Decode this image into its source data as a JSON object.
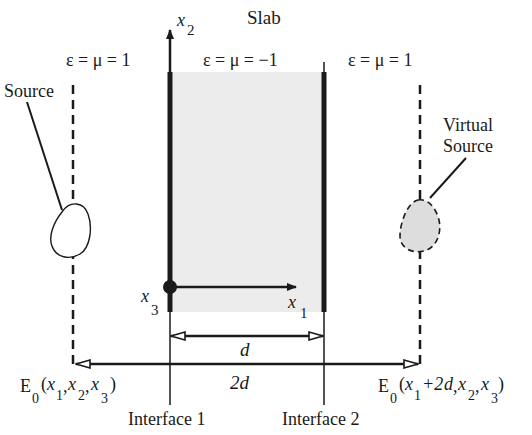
{
  "title": "Slab",
  "regions": {
    "left": {
      "label": "ε = μ = 1"
    },
    "slab": {
      "label": "ε = μ = −1",
      "fill": "#ececec"
    },
    "right": {
      "label": "ε = μ = 1"
    }
  },
  "axes": {
    "x1": {
      "base": "x",
      "sub": "1"
    },
    "x2": {
      "base": "x",
      "sub": "2"
    },
    "x3": {
      "base": "x",
      "sub": "3"
    }
  },
  "source": {
    "label": "Source"
  },
  "virtual_source": {
    "label_line1": "Virtual",
    "label_line2": "Source",
    "fill": "#dddddd"
  },
  "dimensions": {
    "d": "d",
    "two_d": "2d"
  },
  "fields": {
    "left": {
      "E": "E",
      "sub0": "0",
      "open": "(",
      "x": "x",
      "s1": "1",
      "comma1": ",",
      "s2": "2",
      "comma2": ",",
      "s3": "3",
      "close": ")"
    },
    "right": {
      "E": "E",
      "sub0": "0",
      "open": "(",
      "x": "x",
      "s1": "1",
      "plus": "+2",
      "d": "d",
      "comma1": ",",
      "s2": "2",
      "comma2": ",",
      "s3": "3",
      "close": " )"
    }
  },
  "interfaces": {
    "one": "Interface 1",
    "two": "Interface 2"
  },
  "colors": {
    "ink": "#1a1a1a",
    "slab_fill": "#ececec",
    "virtual_fill": "#dddddd"
  }
}
